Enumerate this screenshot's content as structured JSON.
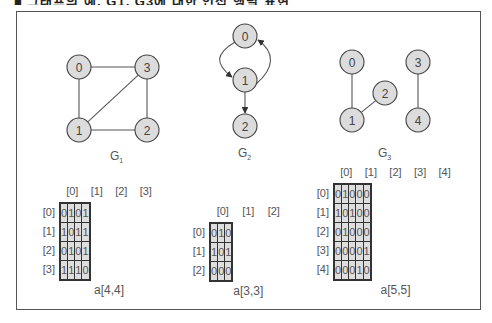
{
  "header": {
    "clipped_title": "■ 그래프의 예, G1, G3에 대한 인접 행렬 표현"
  },
  "graphs": [
    {
      "name": "G",
      "sub": "1",
      "label_pos": [
        110,
        160
      ],
      "directed": false,
      "nodes": [
        {
          "id": "0",
          "x": 79,
          "y": 67
        },
        {
          "id": "1",
          "x": 79,
          "y": 130
        },
        {
          "id": "2",
          "x": 147,
          "y": 130
        },
        {
          "id": "3",
          "x": 147,
          "y": 67
        }
      ],
      "edges": [
        [
          "0",
          "1"
        ],
        [
          "0",
          "3"
        ],
        [
          "1",
          "2"
        ],
        [
          "1",
          "3"
        ],
        [
          "2",
          "3"
        ]
      ]
    },
    {
      "name": "G",
      "sub": "2",
      "label_pos": [
        238,
        157
      ],
      "directed": true,
      "nodes": [
        {
          "id": "0",
          "x": 245,
          "y": 36
        },
        {
          "id": "1",
          "x": 245,
          "y": 80
        },
        {
          "id": "2",
          "x": 245,
          "y": 126
        }
      ],
      "edges": [
        [
          "0",
          "1"
        ],
        [
          "1",
          "0"
        ],
        [
          "1",
          "2"
        ]
      ]
    },
    {
      "name": "G",
      "sub": "3",
      "label_pos": [
        378,
        157
      ],
      "directed": false,
      "nodes": [
        {
          "id": "0",
          "x": 352,
          "y": 62
        },
        {
          "id": "1",
          "x": 352,
          "y": 120
        },
        {
          "id": "2",
          "x": 385,
          "y": 93
        },
        {
          "id": "3",
          "x": 418,
          "y": 62
        },
        {
          "id": "4",
          "x": 418,
          "y": 120
        }
      ],
      "edges": [
        [
          "0",
          "1"
        ],
        [
          "1",
          "2"
        ],
        [
          "3",
          "4"
        ]
      ]
    }
  ],
  "matrices": [
    {
      "label": "a[4,4]",
      "left": 59,
      "top": 202,
      "cell_w": 24.5,
      "col_headers": [
        "[0]",
        "[1]",
        "[2]",
        "[3]"
      ],
      "row_headers": [
        "[0]",
        "[1]",
        "[2]",
        "[3]"
      ],
      "rows": [
        [
          "0",
          "1",
          "0",
          "1"
        ],
        [
          "1",
          "0",
          "1",
          "1"
        ],
        [
          "0",
          "1",
          "0",
          "1"
        ],
        [
          "1",
          "1",
          "1",
          "0"
        ]
      ]
    },
    {
      "label": "a[3,3]",
      "left": 209,
      "top": 222,
      "cell_w": 25.5,
      "col_headers": [
        "[0]",
        "[1]",
        "[2]"
      ],
      "row_headers": [
        "[0]",
        "[1]",
        "[2]"
      ],
      "rows": [
        [
          "0",
          "1",
          "0"
        ],
        [
          "1",
          "0",
          "1"
        ],
        [
          "0",
          "0",
          "0"
        ]
      ]
    },
    {
      "label": "a[5,5]",
      "left": 333,
      "top": 183,
      "cell_w": 24.6,
      "col_headers": [
        "[0]",
        "[1]",
        "[2]",
        "[3]",
        "[4]"
      ],
      "row_headers": [
        "[0]",
        "[1]",
        "[2]",
        "[3]",
        "[4]"
      ],
      "rows": [
        [
          "0",
          "1",
          "0",
          "0",
          "0"
        ],
        [
          "1",
          "0",
          "1",
          "0",
          "0"
        ],
        [
          "0",
          "1",
          "0",
          "0",
          "0"
        ],
        [
          "0",
          "0",
          "0",
          "0",
          "1"
        ],
        [
          "0",
          "0",
          "0",
          "1",
          "0"
        ]
      ]
    }
  ]
}
